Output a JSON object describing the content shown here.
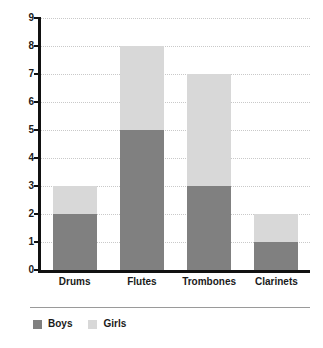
{
  "chart_data": {
    "type": "bar",
    "subtype": "stacked-bar",
    "title": "",
    "xlabel": "",
    "ylabel": "",
    "categories": [
      "Drums",
      "Flutes",
      "Trombones",
      "Clarinets"
    ],
    "series": [
      {
        "name": "Boys",
        "values": [
          2,
          5,
          3,
          1
        ],
        "color": "#808080"
      },
      {
        "name": "Girls",
        "values": [
          1,
          3,
          4,
          1
        ],
        "color": "#d8d8d8"
      }
    ],
    "totals": [
      3,
      8,
      7,
      2
    ],
    "ylim": [
      0,
      9
    ],
    "ytick_step": 1,
    "yticks": [
      0,
      1,
      2,
      3,
      4,
      5,
      6,
      7,
      8,
      9
    ],
    "ytick_labels": [
      "0",
      "1",
      "2",
      "3",
      "4",
      "5",
      "6",
      "7",
      "8",
      "9"
    ],
    "grid": true,
    "grid_axis": "y",
    "grid_style": "dotted",
    "grid_color": "#c9c9c9",
    "legend": true,
    "legend_position": "bottom-left",
    "axis_color": "#111111",
    "background": "#ffffff"
  }
}
